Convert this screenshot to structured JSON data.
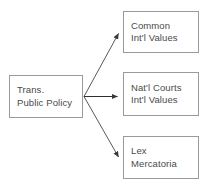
{
  "diagram": {
    "type": "flow-diagram",
    "background_color": "#ffffff",
    "box_border_color": "#9a9a9a",
    "text_color": "#4a4a4a",
    "edge_color": "#3a3a3a",
    "source": {
      "id": "trans-public-policy",
      "line1": "Trans.",
      "line2": "Public Policy"
    },
    "targets": [
      {
        "id": "common-intl-values",
        "line1": "Common",
        "line2": "Int'l Values"
      },
      {
        "id": "natl-courts-intl-values",
        "line1": "Nat'l Courts",
        "line2": "Int'l Values"
      },
      {
        "id": "lex-mercatoria",
        "line1": "Lex",
        "line2": "Mercatoria"
      }
    ],
    "edges": [
      {
        "id": "edge-to-common",
        "from": "trans-public-policy",
        "to": "common-intl-values",
        "direction": "up-right",
        "arrowhead": true
      },
      {
        "id": "edge-to-natl-courts",
        "from": "trans-public-policy",
        "to": "natl-courts-intl-values",
        "direction": "right",
        "arrowhead": true
      },
      {
        "id": "edge-to-lex",
        "from": "trans-public-policy",
        "to": "lex-mercatoria",
        "direction": "down-right",
        "arrowhead": true
      }
    ]
  }
}
